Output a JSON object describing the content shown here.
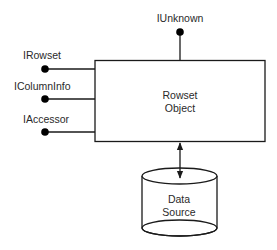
{
  "diagram": {
    "object": {
      "line1": "Rowset",
      "line2": "Object"
    },
    "interfaces": {
      "top": "IUnknown",
      "left": [
        "IRowset",
        "IColumnInfo",
        "IAccessor"
      ]
    },
    "data_source": {
      "line1": "Data",
      "line2": "Source"
    },
    "colors": {
      "stroke": "#1a1a1a",
      "background": "#ffffff"
    }
  }
}
